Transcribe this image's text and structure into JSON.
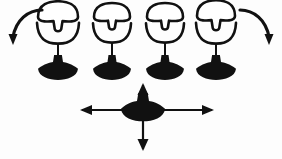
{
  "figure": {
    "title": "Gyroscope rotation and translation diagram",
    "background_color": "#fdfdfd",
    "ink_color": "#111111",
    "fill_light_color": "#ffffff",
    "width": 282,
    "height": 159
  },
  "top_row": {
    "label": "rotation row",
    "count": 4,
    "units": [
      {
        "id": "unit-1",
        "label": "gyroscope figure 1",
        "center_x": 58,
        "cap_cy": 17,
        "cap_rx": 20,
        "cap_ry": 9,
        "stub_w": 9,
        "stub_h": 8,
        "bowl_cy": 30,
        "bowl_rx": 21,
        "bowl_ry": 13,
        "stem_top": 43,
        "stem_bottom": 64,
        "base_cy": 70,
        "base_rx": 20,
        "base_ry": 8,
        "knob_w": 10,
        "knob_h": 7
      },
      {
        "id": "unit-2",
        "label": "gyroscope figure 2",
        "center_x": 112,
        "cap_cy": 17,
        "cap_rx": 18,
        "cap_ry": 8,
        "stub_w": 8,
        "stub_h": 7,
        "bowl_cy": 30,
        "bowl_rx": 19,
        "bowl_ry": 12,
        "stem_top": 42,
        "stem_bottom": 64,
        "base_cy": 70,
        "base_rx": 19,
        "base_ry": 8,
        "knob_w": 9,
        "knob_h": 7
      },
      {
        "id": "unit-3",
        "label": "gyroscope figure 3",
        "center_x": 165,
        "cap_cy": 17,
        "cap_rx": 18,
        "cap_ry": 8,
        "stub_w": 8,
        "stub_h": 7,
        "bowl_cy": 30,
        "bowl_rx": 19,
        "bowl_ry": 12,
        "stem_top": 42,
        "stem_bottom": 64,
        "base_cy": 70,
        "base_rx": 19,
        "base_ry": 8,
        "knob_w": 9,
        "knob_h": 7
      },
      {
        "id": "unit-4",
        "label": "gyroscope figure 4",
        "center_x": 216,
        "cap_cy": 16,
        "cap_rx": 19,
        "cap_ry": 9,
        "stub_w": 9,
        "stub_h": 8,
        "bowl_cy": 30,
        "bowl_rx": 20,
        "bowl_ry": 13,
        "stem_top": 43,
        "stem_bottom": 64,
        "base_cy": 70,
        "base_rx": 20,
        "base_ry": 8,
        "knob_w": 10,
        "knob_h": 7
      }
    ]
  },
  "rotation_arrows": [
    {
      "id": "arc-arrow-left",
      "label": "counter-clockwise rotation arrow left",
      "direction": "down-left",
      "path": "M 42 10 C 28 10, 16 20, 13 37",
      "head_points": "13,45 8.5,34 17.5,34"
    },
    {
      "id": "arc-arrow-right",
      "label": "clockwise rotation arrow right",
      "direction": "down-right",
      "path": "M 240 10 C 254 10, 266 20, 269 37",
      "head_points": "269,45 264.5,34 273.5,34"
    }
  ],
  "bottom_unit": {
    "id": "translation-unit",
    "label": "gyroscope figure centered on translation cross",
    "center_x": 143,
    "center_y": 110,
    "base_rx": 22,
    "base_ry": 9,
    "knob_w": 12,
    "knob_h": 8
  },
  "translation_cross": {
    "label": "four-way translation arrows",
    "center_x": 143,
    "center_y": 110,
    "left_x": 82,
    "right_x": 212,
    "top_y": 85,
    "bottom_y": 149,
    "arrows": [
      {
        "id": "cross-arrow-left",
        "label": "left translation arrow",
        "direction": "left",
        "head_points": "80,110 92,105 92,115"
      },
      {
        "id": "cross-arrow-right",
        "label": "right translation arrow",
        "direction": "right",
        "head_points": "214,110 202,105 202,115"
      },
      {
        "id": "cross-arrow-up",
        "label": "up translation arrow",
        "direction": "up",
        "head_points": "143,83 137.5,95 148.5,95"
      },
      {
        "id": "cross-arrow-down",
        "label": "down translation arrow",
        "direction": "down",
        "head_points": "143,151 137.5,139 148.5,139"
      }
    ]
  }
}
